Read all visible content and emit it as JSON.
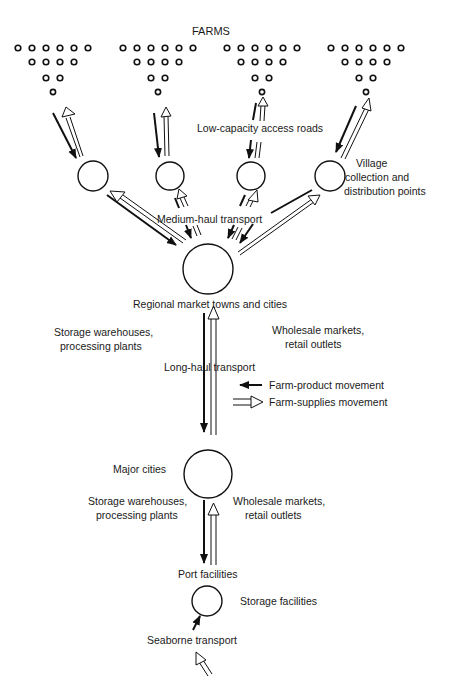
{
  "title": "FARMS",
  "labels": {
    "access_roads": "Low-capacity access roads",
    "village_line1": "Village",
    "village_line2": "collection and",
    "village_line3": "distribution points",
    "medium_haul": "Medium-haul transport",
    "regional": "Regional market towns and cities",
    "storage_left_1_line1": "Storage warehouses,",
    "storage_left_1_line2": "processing plants",
    "wholesale_right_1_line1": "Wholesale markets,",
    "wholesale_right_1_line2": "retail outlets",
    "long_haul": "Long-haul transport",
    "major_cities": "Major cities",
    "storage_left_2_line1": "Storage warehouses,",
    "storage_left_2_line2": "processing plants",
    "wholesale_right_2_line1": "Wholesale markets,",
    "wholesale_right_2_line2": "retail outlets",
    "port": "Port facilities",
    "storage_facilities": "Storage facilities",
    "seaborne": "Seaborne transport"
  },
  "legend": {
    "items": [
      {
        "symbol": "solid-arrow",
        "label": "Farm-product movement"
      },
      {
        "symbol": "hollow-arrow",
        "label": "Farm-supplies movement"
      }
    ]
  },
  "structure": {
    "farm_clusters": 4,
    "farm_rows_per_cluster": [
      6,
      4,
      2,
      1
    ],
    "village_points": 4,
    "hierarchy": [
      "Farms",
      "Village collection and distribution points",
      "Regional market towns and cities",
      "Major cities",
      "Port facilities"
    ]
  }
}
